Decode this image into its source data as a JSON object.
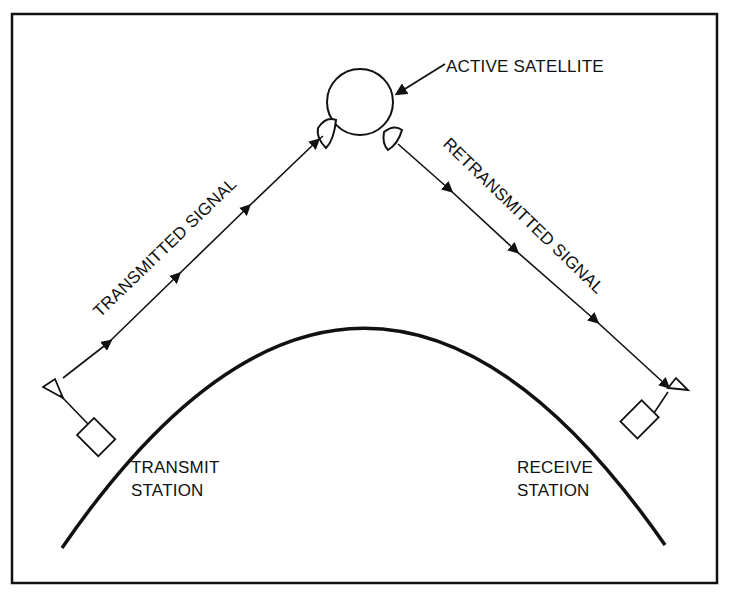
{
  "diagram": {
    "colors": {
      "ink": "#111111",
      "background": "#ffffff"
    },
    "labels": {
      "satellite": "ACTIVE SATELLITE",
      "uplink": "TRANSMITTED SIGNAL",
      "downlink": "RETRANSMITTED SIGNAL",
      "transmit_line1": "TRANSMIT",
      "transmit_line2": "STATION",
      "receive_line1": "RECEIVE",
      "receive_line2": "STATION"
    },
    "nodes": [
      {
        "id": "transmit-station",
        "label": "TRANSMIT STATION"
      },
      {
        "id": "active-satellite",
        "label": "ACTIVE SATELLITE"
      },
      {
        "id": "receive-station",
        "label": "RECEIVE STATION"
      }
    ],
    "edges": [
      {
        "from": "transmit-station",
        "to": "active-satellite",
        "label": "TRANSMITTED SIGNAL"
      },
      {
        "from": "active-satellite",
        "to": "receive-station",
        "label": "RETRANSMITTED SIGNAL"
      }
    ]
  }
}
